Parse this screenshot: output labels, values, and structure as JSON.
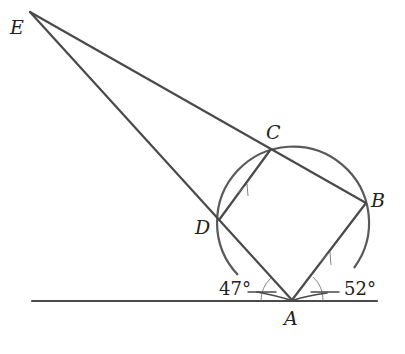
{
  "diagram": {
    "type": "circle-geometry",
    "points": {
      "E": {
        "label": "E",
        "x": 30,
        "y": 12
      },
      "C": {
        "label": "C",
        "x": 271,
        "y": 149
      },
      "B": {
        "label": "B",
        "x": 366,
        "y": 203
      },
      "D": {
        "label": "D",
        "x": 219,
        "y": 220
      },
      "A": {
        "label": "A",
        "x": 292,
        "y": 300
      }
    },
    "labels": {
      "E": "E",
      "C": "C",
      "B": "B",
      "D": "D",
      "A": "A"
    },
    "angles": {
      "left": "47°",
      "right": "52°"
    },
    "segments": [
      "E-B",
      "E-A",
      "D-C",
      "C-B",
      "A-B",
      "A-D",
      "tangent at A"
    ],
    "parallel_marks": [
      "DC",
      "AB"
    ],
    "circle": {
      "cx": 292,
      "cy": 222,
      "r": 76
    },
    "colors": {
      "stroke": "#4a4a4a",
      "text": "#222222",
      "background": "#ffffff"
    }
  }
}
